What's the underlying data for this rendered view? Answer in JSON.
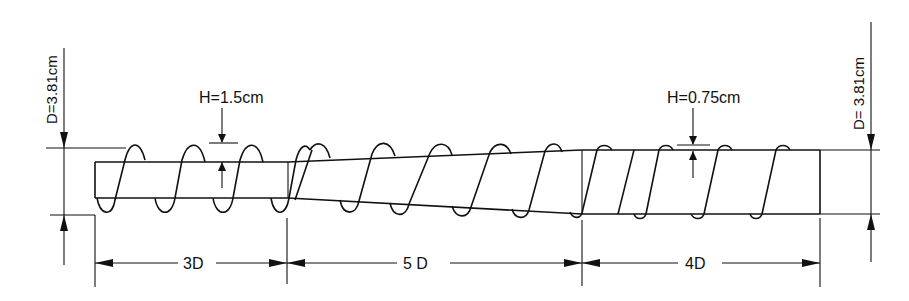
{
  "figure": {
    "ink_color": "#111111",
    "background": "#ffffff"
  },
  "left_diameter": {
    "label": "D=3.81cm"
  },
  "right_diameter": {
    "label": "D= 3.81cm"
  },
  "rib_height_left": {
    "label": "H=1.5cm"
  },
  "rib_height_right": {
    "label": "H=0.75cm"
  },
  "sections": [
    {
      "id": "section-1",
      "label": "3D",
      "rib_height": "H=1.5cm",
      "shape": "constant"
    },
    {
      "id": "section-2",
      "label": "5 D",
      "shape": "tapered transition"
    },
    {
      "id": "section-3",
      "label": "4D",
      "rib_height": "H=0.75cm",
      "shape": "constant"
    }
  ]
}
